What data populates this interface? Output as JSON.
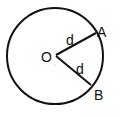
{
  "diagram": {
    "type": "circle-geometry",
    "circle": {
      "cx": 55,
      "cy": 56,
      "r": 48,
      "stroke": "#111111"
    },
    "center": {
      "label": "O",
      "x": 55,
      "y": 57
    },
    "points": [
      {
        "label": "A",
        "x": 96,
        "y": 32
      },
      {
        "label": "B",
        "x": 90,
        "y": 86
      }
    ],
    "segments": [
      {
        "from": "O",
        "to": "A",
        "label": "d"
      },
      {
        "from": "O",
        "to": "B",
        "label": "d"
      }
    ]
  }
}
